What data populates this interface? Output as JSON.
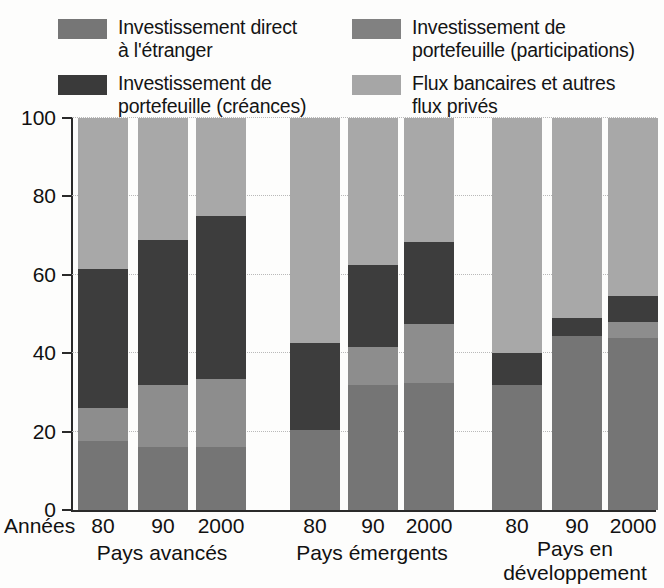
{
  "legend": {
    "items": [
      {
        "key": "fdi",
        "label": "Investissement direct\nà l'étranger",
        "color": "#767676",
        "icon": "legend-swatch-icon"
      },
      {
        "key": "equity",
        "label": "Investissement de\nportefeuille (participations)",
        "color": "#818181",
        "icon": "legend-swatch-icon"
      },
      {
        "key": "debt",
        "label": "Investissement de\nportefeuille (créances)",
        "color": "#3a3a3a",
        "icon": "legend-swatch-icon"
      },
      {
        "key": "bank",
        "label": "Flux bancaires et autres\nflux privés",
        "color": "#a6a6a6",
        "icon": "legend-swatch-icon"
      }
    ]
  },
  "axis": {
    "x_axis_row_label": "Années",
    "y_ticks": [
      "100",
      "80",
      "60",
      "40",
      "20",
      "0"
    ],
    "x_tick_labels": [
      "80",
      "90",
      "2000",
      "80",
      "90",
      "2000",
      "80",
      "90",
      "2000"
    ],
    "group_labels": [
      "Pays avancés",
      "Pays émergents",
      "Pays en\ndéveloppement"
    ]
  },
  "chart_data": {
    "type": "bar",
    "stacked": true,
    "stacked_mode": "percent",
    "title": "",
    "xlabel": "Années",
    "ylabel": "",
    "ylim": [
      0,
      100
    ],
    "yticks": [
      0,
      20,
      40,
      60,
      80,
      100
    ],
    "grid": true,
    "legend_position": "top",
    "groups": [
      "Pays avancés",
      "Pays émergents",
      "Pays en développement"
    ],
    "categories": [
      "80",
      "90",
      "2000",
      "80",
      "90",
      "2000",
      "80",
      "90",
      "2000"
    ],
    "series": [
      {
        "name": "Investissement direct à l'étranger",
        "color": "#757575",
        "values": [
          17.5,
          16,
          16,
          20.5,
          32,
          32.5,
          32,
          44.5,
          44
        ]
      },
      {
        "name": "Investissement de portefeuille (participations)",
        "color": "#8d8d8d",
        "values": [
          8.5,
          16,
          17.5,
          0,
          9.5,
          15,
          0,
          0,
          4
        ]
      },
      {
        "name": "Investissement de portefeuille (créances)",
        "color": "#3d3d3d",
        "values": [
          35.5,
          37,
          41.5,
          22,
          21,
          21,
          8,
          4.5,
          6.5
        ]
      },
      {
        "name": "Flux bancaires et autres flux privés",
        "color": "#a8a8a8",
        "values": [
          38.5,
          31,
          25,
          57.5,
          37.5,
          31.5,
          60,
          51,
          45.5
        ]
      }
    ],
    "cumulative_tops": {
      "fdi": [
        17.5,
        16,
        16,
        20.5,
        32,
        32.5,
        32,
        44.5,
        44
      ],
      "equity": [
        26,
        32,
        33.5,
        20.5,
        41.5,
        47.5,
        32,
        44.5,
        48
      ],
      "debt": [
        61.5,
        69,
        75,
        42.5,
        62.5,
        68.5,
        40,
        49,
        54.5
      ],
      "bank": [
        100,
        100,
        100,
        100,
        100,
        100,
        100,
        100,
        100
      ]
    }
  },
  "colors": {
    "fdi": "#757575",
    "equity": "#8d8d8d",
    "debt": "#3d3d3d",
    "bank": "#a8a8a8",
    "axis": "#2a2a2a",
    "grid": "#b9b9b9",
    "background": "#fdfdfc"
  }
}
